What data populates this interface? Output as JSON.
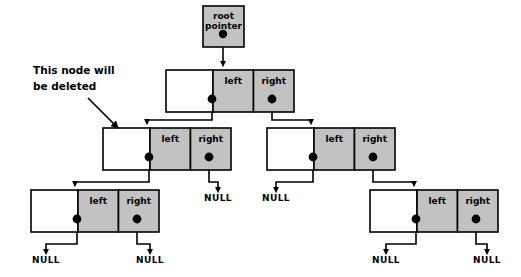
{
  "diagram": {
    "background_color": "#ffffff",
    "node_fill_color": "#c2c2c2",
    "data_cell_color": "#ffffff",
    "stroke_color": "#000000",
    "annotation": {
      "line1": "This node will",
      "line2": "be deleted"
    },
    "root": {
      "label_line1": "root",
      "label_line2": "pointer"
    },
    "labels": {
      "left": "left",
      "right": "right",
      "null": "NULL"
    },
    "nodes": [
      {
        "id": "root-pointer",
        "kind": "root-pointer",
        "x": 203,
        "y": 6,
        "w": 41,
        "h": 41,
        "text_line1": "root",
        "text_line2": "pointer",
        "dot_x": 223,
        "dot_y": 34
      },
      {
        "id": "node-level2",
        "kind": "tree-node",
        "x": 166,
        "y": 70,
        "w": 128,
        "h": 42,
        "data_w": 47,
        "left_label": "left",
        "right_label": "right",
        "left_dot_x": 212,
        "right_dot_x": 272,
        "dot_y": 99
      },
      {
        "id": "node-level3-left",
        "kind": "tree-node",
        "x": 103,
        "y": 128,
        "w": 128,
        "h": 42,
        "data_w": 47,
        "left_label": "left",
        "right_label": "right",
        "left_dot_x": 149,
        "right_dot_x": 209,
        "dot_y": 157
      },
      {
        "id": "node-level3-right",
        "kind": "tree-node",
        "x": 267,
        "y": 128,
        "w": 128,
        "h": 42,
        "data_w": 47,
        "left_label": "left",
        "right_label": "right",
        "left_dot_x": 313,
        "right_dot_x": 373,
        "dot_y": 157
      },
      {
        "id": "node-level4-left",
        "kind": "tree-node",
        "x": 31,
        "y": 190,
        "w": 128,
        "h": 42,
        "data_w": 47,
        "left_label": "left",
        "right_label": "right",
        "left_dot_x": 77,
        "right_dot_x": 137,
        "dot_y": 219
      },
      {
        "id": "node-level4-right",
        "kind": "tree-node",
        "x": 370,
        "y": 190,
        "w": 128,
        "h": 42,
        "data_w": 47,
        "left_label": "left",
        "right_label": "right",
        "left_dot_x": 416,
        "right_dot_x": 476,
        "dot_y": 219
      }
    ],
    "links": [
      {
        "id": "link-root-to-level2",
        "path": "M 223 34 L 223 64"
      },
      {
        "id": "link-level2-left-to-level3-left",
        "path": "M 212 99 L 212 120 L 147 120 L 147 122"
      },
      {
        "id": "link-level2-right-to-level3-right",
        "path": "M 272 99 L 272 120 L 311 120 L 311 122"
      },
      {
        "id": "link-level3-left-left-to-level4-left",
        "path": "M 149 157 L 149 182 L 75 182 L 75 184"
      },
      {
        "id": "link-level3-right-right-to-level4-right",
        "path": "M 373 157 L 373 182 L 414 182 L 414 184"
      }
    ],
    "null_pointers": [
      {
        "id": "null-level3-left-right",
        "label": "NULL",
        "path": "M 209 157 L 209 182 L 218 182 L 218 190",
        "text_x": 218,
        "text_y": 201
      },
      {
        "id": "null-level3-right-left",
        "label": "NULL",
        "path": "M 313 157 L 313 182 L 276 182 L 276 190",
        "text_x": 276,
        "text_y": 201
      },
      {
        "id": "null-level4-left-left",
        "label": "NULL",
        "path": "M 77 219 L 77 244 L 46 244 L 46 252",
        "text_x": 46,
        "text_y": 263
      },
      {
        "id": "null-level4-left-right",
        "label": "NULL",
        "path": "M 137 219 L 137 244 L 150 244 L 150 252",
        "text_x": 150,
        "text_y": 263
      },
      {
        "id": "null-level4-right-left",
        "label": "NULL",
        "path": "M 416 219 L 416 244 L 386 244 L 386 252",
        "text_x": 386,
        "text_y": 263
      },
      {
        "id": "null-level4-right-right",
        "label": "NULL",
        "path": "M 476 219 L 476 244 L 487 244 L 487 252",
        "text_x": 487,
        "text_y": 263
      }
    ],
    "annotation_arrow": {
      "path": "M 88 98 L 116 126"
    },
    "annotation_text_pos": {
      "x": 33,
      "y1": 74,
      "y2": 90
    }
  }
}
